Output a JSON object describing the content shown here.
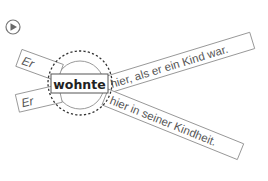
{
  "play_button": {
    "icon": "play-icon",
    "color": "#6a6a6a"
  },
  "diagram": {
    "verb": "wohnte",
    "subjects": [
      "Er",
      "Er"
    ],
    "continuations": [
      "hier, als er ein Kind war.",
      "hier in seiner Kindheit."
    ]
  },
  "colors": {
    "box_stroke": "#8a8a8a",
    "text": "#555555",
    "verb_text": "#222222",
    "dashed_circle": "#333333",
    "inner_circle": "#9a9a9a"
  }
}
